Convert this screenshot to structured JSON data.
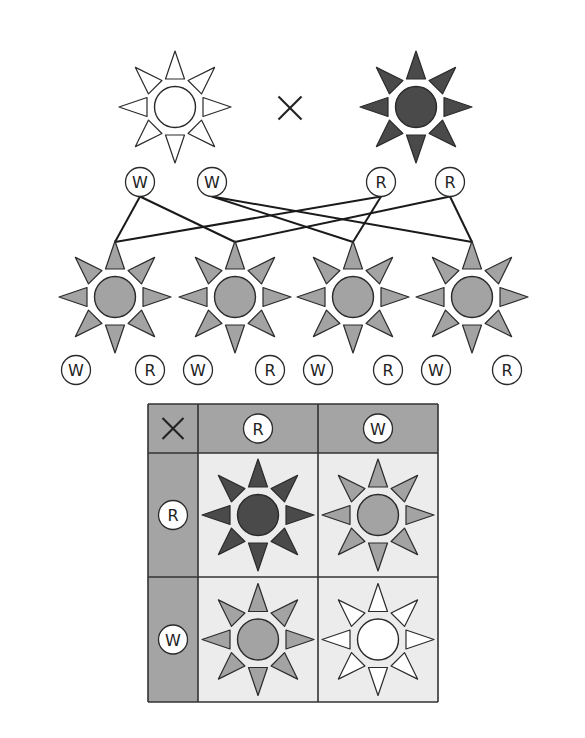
{
  "colors": {
    "white": "#ffffff",
    "pink": "#a3a3a3",
    "red": "#4a4a4a",
    "outline": "#2a2a2a",
    "grid_header": "#a4a4a4",
    "grid_cell": "#ececec",
    "grid_line": "#333333",
    "line": "#1a1a1a"
  },
  "parents": {
    "cross_symbol": "×",
    "items": [
      {
        "name": "parent-white",
        "phenotype": "white",
        "cx": 175,
        "cy": 107
      },
      {
        "name": "parent-red",
        "phenotype": "red",
        "cx": 416,
        "cy": 107
      }
    ],
    "cross_pos": {
      "cx": 290,
      "cy": 108
    }
  },
  "gametes": [
    {
      "label": "W",
      "cx": 140,
      "cy": 182
    },
    {
      "label": "W",
      "cx": 212,
      "cy": 182
    },
    {
      "label": "R",
      "cx": 381,
      "cy": 182
    },
    {
      "label": "R",
      "cx": 450,
      "cy": 182
    }
  ],
  "connections": [
    {
      "from": 0,
      "to": 0
    },
    {
      "from": 0,
      "to": 1
    },
    {
      "from": 1,
      "to": 2
    },
    {
      "from": 1,
      "to": 3
    },
    {
      "from": 2,
      "to": 0
    },
    {
      "from": 2,
      "to": 2
    },
    {
      "from": 3,
      "to": 1
    },
    {
      "from": 3,
      "to": 3
    }
  ],
  "offspring": [
    {
      "phenotype": "pink",
      "cx": 115,
      "cy": 297,
      "alleles": [
        "W",
        "R"
      ],
      "allele_x": [
        76,
        150
      ]
    },
    {
      "phenotype": "pink",
      "cx": 235,
      "cy": 297,
      "alleles": [
        "W",
        "R"
      ],
      "allele_x": [
        198,
        270
      ]
    },
    {
      "phenotype": "pink",
      "cx": 353,
      "cy": 297,
      "alleles": [
        "W",
        "R"
      ],
      "allele_x": [
        318,
        388
      ]
    },
    {
      "phenotype": "pink",
      "cx": 472,
      "cy": 297,
      "alleles": [
        "W",
        "R"
      ],
      "allele_x": [
        436,
        507
      ]
    }
  ],
  "offspring_allele_y": 370,
  "punnett": {
    "corner_symbol": "×",
    "col_headers": [
      "R",
      "W"
    ],
    "row_headers": [
      "R",
      "W"
    ],
    "cells": [
      [
        "red",
        "pink"
      ],
      [
        "pink",
        "white"
      ]
    ],
    "geometry": {
      "x": [
        148,
        198,
        318,
        438
      ],
      "y": [
        404,
        453,
        577,
        702
      ]
    }
  }
}
